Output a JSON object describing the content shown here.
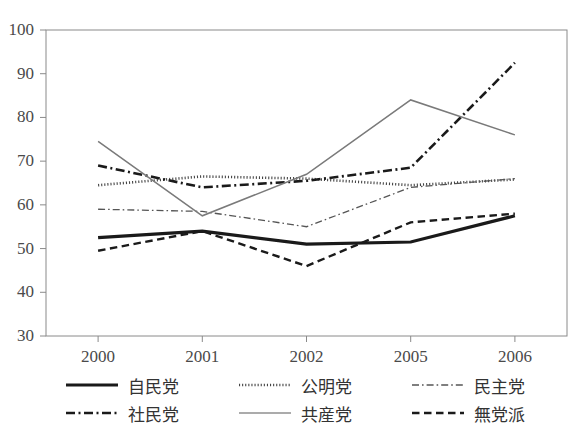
{
  "chart_data": {
    "type": "line",
    "title": "",
    "xlabel": "",
    "ylabel": "",
    "categories": [
      "2000",
      "2001",
      "2002",
      "2005",
      "2006"
    ],
    "ylim": [
      30,
      100
    ],
    "yticks": [
      30,
      40,
      50,
      60,
      70,
      80,
      90,
      100
    ],
    "grid": false,
    "legend_position": "bottom",
    "series": [
      {
        "name": "自民党",
        "values": [
          52.5,
          54.0,
          51.0,
          51.5,
          57.5
        ],
        "style": "solid",
        "width": "thick",
        "color": "#1a1a1a"
      },
      {
        "name": "公明党",
        "values": [
          64.5,
          66.5,
          66.0,
          64.5,
          65.8
        ],
        "style": "dotted",
        "width": "medium",
        "color": "#444444"
      },
      {
        "name": "民主党",
        "values": [
          59.0,
          58.5,
          55.0,
          64.0,
          66.0
        ],
        "style": "dash-dot",
        "width": "thin",
        "color": "#555555"
      },
      {
        "name": "社民党",
        "values": [
          69.0,
          64.0,
          65.5,
          68.5,
          92.5
        ],
        "style": "dash-dot",
        "width": "thick",
        "color": "#1a1a1a"
      },
      {
        "name": "共産党",
        "values": [
          74.5,
          57.5,
          67.0,
          84.0,
          76.0
        ],
        "style": "solid",
        "width": "thin",
        "color": "#7a7a7a"
      },
      {
        "name": "無党派",
        "values": [
          49.5,
          54.0,
          46.0,
          56.0,
          58.0
        ],
        "style": "dashed",
        "width": "medium",
        "color": "#1a1a1a"
      }
    ]
  },
  "axis": {
    "y_ticks": [
      "100",
      "90",
      "80",
      "70",
      "60",
      "50",
      "40",
      "30"
    ],
    "x_ticks": [
      "2000",
      "2001",
      "2002",
      "2005",
      "2006"
    ]
  },
  "legend": {
    "items": [
      {
        "label": "自民党"
      },
      {
        "label": "公明党"
      },
      {
        "label": "民主党"
      },
      {
        "label": "社民党"
      },
      {
        "label": "共産党"
      },
      {
        "label": "無党派"
      }
    ]
  },
  "colors": {
    "frame": "#8a8a8a",
    "tick_text": "#4a4a4a",
    "background": "#ffffff"
  }
}
